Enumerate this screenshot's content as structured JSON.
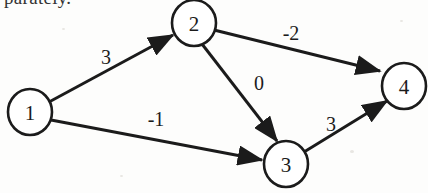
{
  "page": {
    "background_color": "#fdfdfc",
    "ink_color": "#1b1b1b",
    "partial_text_top": "parately."
  },
  "graph": {
    "type": "directed-weighted-graph",
    "nodes": [
      {
        "id": "1",
        "label": "1",
        "cx": 30,
        "cy": 112,
        "r": 21
      },
      {
        "id": "2",
        "label": "2",
        "cx": 194,
        "cy": 23,
        "r": 21
      },
      {
        "id": "3",
        "label": "3",
        "cx": 286,
        "cy": 164,
        "r": 21
      },
      {
        "id": "4",
        "label": "4",
        "cx": 404,
        "cy": 86,
        "r": 21
      }
    ],
    "edges": [
      {
        "from": "1",
        "to": "2",
        "weight": "3",
        "label_x": 106,
        "label_y": 57
      },
      {
        "from": "1",
        "to": "3",
        "weight": "-1",
        "label_x": 156,
        "label_y": 119
      },
      {
        "from": "2",
        "to": "4",
        "weight": "-2",
        "label_x": 291,
        "label_y": 33
      },
      {
        "from": "2",
        "to": "3",
        "weight": "0",
        "label_x": 259,
        "label_y": 83
      },
      {
        "from": "3",
        "to": "4",
        "weight": "3",
        "label_x": 331,
        "label_y": 124
      }
    ]
  }
}
